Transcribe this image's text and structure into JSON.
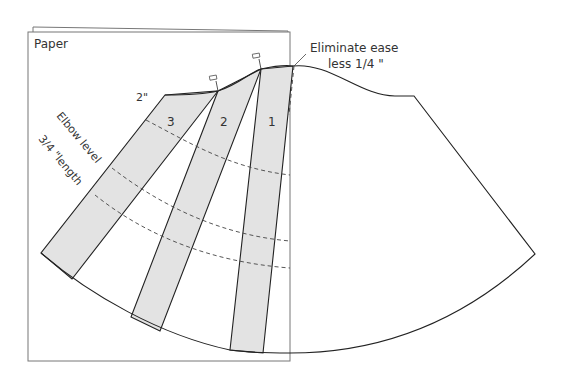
{
  "diagram": {
    "paper_label": "Paper",
    "top_label": "2\"",
    "annotation_line1": "Eliminate ease",
    "annotation_line2": "less 1/4 \"",
    "side_labels": {
      "elbow": "Elbow level",
      "length": "3/4 \"length"
    },
    "strips": [
      {
        "id": 1,
        "label": "1"
      },
      {
        "id": 2,
        "label": "2"
      },
      {
        "id": 3,
        "label": "3"
      }
    ],
    "pins": [
      "pin-1",
      "pin-2"
    ],
    "colors": {
      "strip_fill": "#e3e3e3",
      "line": "#222222",
      "paper_edge": "#777777"
    }
  }
}
